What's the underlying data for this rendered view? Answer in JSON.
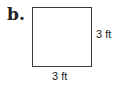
{
  "figure": {
    "label": "b.",
    "shape": "square",
    "dimensions": {
      "right": "3 ft",
      "bottom": "3 ft"
    }
  }
}
